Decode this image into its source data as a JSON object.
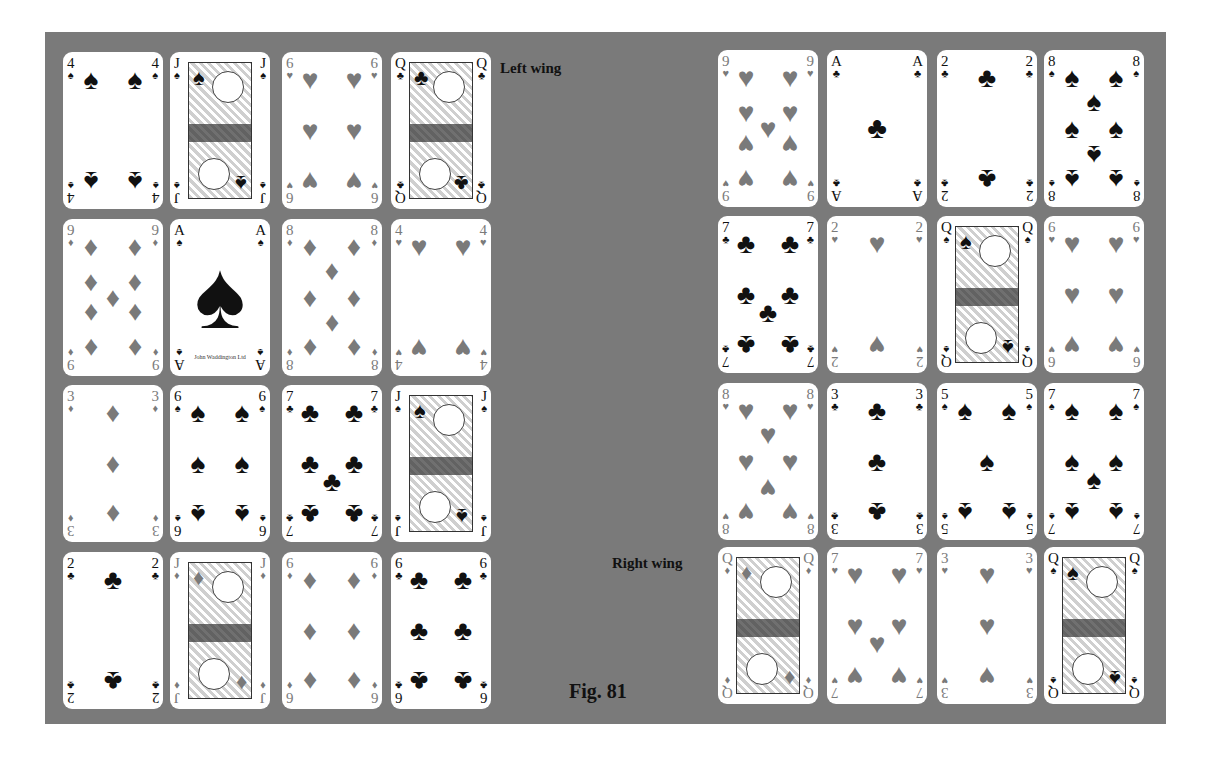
{
  "figure": {
    "caption": "Fig. 81",
    "left_label": "Left wing",
    "right_label": "Right wing",
    "colors": {
      "board": "#7a7a7a",
      "card": "#ffffff",
      "red_suit": "#7a7a7a",
      "black_suit": "#111111"
    }
  },
  "suits": {
    "spades": "♠",
    "hearts": "♥",
    "diamonds": "♦",
    "clubs": "♣"
  },
  "left_wing": {
    "rows": [
      [
        {
          "rank": "4",
          "suit": "spades"
        },
        {
          "rank": "J",
          "suit": "spades"
        },
        {
          "rank": "6",
          "suit": "hearts"
        },
        {
          "rank": "Q",
          "suit": "clubs"
        }
      ],
      [
        {
          "rank": "9",
          "suit": "diamonds"
        },
        {
          "rank": "A",
          "suit": "spades",
          "maker": "John Waddington Ltd"
        },
        {
          "rank": "8",
          "suit": "diamonds"
        },
        {
          "rank": "4",
          "suit": "hearts"
        }
      ],
      [
        {
          "rank": "3",
          "suit": "diamonds"
        },
        {
          "rank": "6",
          "suit": "spades"
        },
        {
          "rank": "7",
          "suit": "clubs"
        },
        {
          "rank": "J",
          "suit": "spades"
        }
      ],
      [
        {
          "rank": "2",
          "suit": "clubs"
        },
        {
          "rank": "J",
          "suit": "diamonds"
        },
        {
          "rank": "6",
          "suit": "diamonds"
        },
        {
          "rank": "6",
          "suit": "clubs"
        }
      ]
    ]
  },
  "right_wing": {
    "rows": [
      [
        {
          "rank": "9",
          "suit": "hearts"
        },
        {
          "rank": "A",
          "suit": "clubs"
        },
        {
          "rank": "2",
          "suit": "clubs"
        },
        {
          "rank": "8",
          "suit": "spades"
        }
      ],
      [
        {
          "rank": "7",
          "suit": "clubs"
        },
        {
          "rank": "2",
          "suit": "hearts"
        },
        {
          "rank": "Q",
          "suit": "spades"
        },
        {
          "rank": "6",
          "suit": "hearts"
        }
      ],
      [
        {
          "rank": "8",
          "suit": "hearts"
        },
        {
          "rank": "3",
          "suit": "clubs"
        },
        {
          "rank": "5",
          "suit": "spades"
        },
        {
          "rank": "7",
          "suit": "spades"
        }
      ],
      [
        {
          "rank": "Q",
          "suit": "diamonds"
        },
        {
          "rank": "7",
          "suit": "hearts"
        },
        {
          "rank": "3",
          "suit": "hearts"
        },
        {
          "rank": "Q",
          "suit": "spades"
        }
      ]
    ]
  }
}
